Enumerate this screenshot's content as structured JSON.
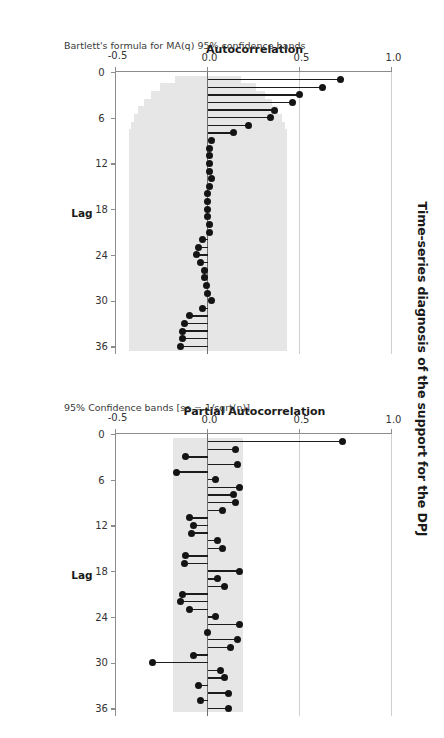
{
  "title": "Time-series diagnosis of the support for the DPJ",
  "orientation_deg": 90,
  "panels": [
    {
      "id": "acf",
      "ylabel": "Autocorrelation",
      "xlabel": "Lag",
      "note": "Bartlett's formula for MA(q) 95% confidence bands"
    },
    {
      "id": "pacf",
      "ylabel": "Partial Autocorrelation",
      "xlabel": "Lag",
      "note": "95% Confidence bands [se = 1/sqrt(n)]"
    }
  ],
  "axis": {
    "y_ticks": [
      "1.0",
      "0.5",
      "0.0",
      "-0.5"
    ],
    "y_tick_values": [
      1.0,
      0.5,
      0.0,
      -0.5
    ],
    "y_min": -0.5,
    "y_max": 1.0,
    "x_ticks": [
      "0",
      "6",
      "12",
      "18",
      "24",
      "30",
      "36"
    ],
    "x_tick_values": [
      0,
      6,
      12,
      18,
      24,
      30,
      36
    ],
    "x_min": 0,
    "x_max": 37
  },
  "colors": {
    "band": "#e6e6e6",
    "marker": "#141414",
    "stem": "#1c1c1c",
    "grid": "#cfcfcf",
    "axis": "#8c8c8c",
    "text": "#1a1a1a",
    "background": "#ffffff"
  },
  "chart_data": [
    {
      "type": "bar",
      "id": "acf",
      "title": "Time-series diagnosis of the support for the DPJ",
      "subtitle": "Bartlett's formula for MA(q) 95% confidence bands",
      "xlabel": "Lag",
      "ylabel": "Autocorrelation",
      "xlim": [
        0,
        37
      ],
      "ylim": [
        -0.5,
        1.0
      ],
      "grid": true,
      "legend": null,
      "marker": "stem-and-dot",
      "categories": [
        1,
        2,
        3,
        4,
        5,
        6,
        7,
        8,
        9,
        10,
        11,
        12,
        13,
        14,
        15,
        16,
        17,
        18,
        19,
        20,
        21,
        22,
        23,
        24,
        25,
        26,
        27,
        28,
        29,
        30,
        31,
        32,
        33,
        34,
        35,
        36
      ],
      "values": [
        0.72,
        0.62,
        0.5,
        0.46,
        0.36,
        0.34,
        0.22,
        0.14,
        0.02,
        0.01,
        0.01,
        0.01,
        0.01,
        0.02,
        0.01,
        0.0,
        0.0,
        0.0,
        0.0,
        0.01,
        0.01,
        -0.03,
        -0.05,
        -0.06,
        -0.04,
        -0.02,
        -0.02,
        -0.01,
        0.0,
        0.02,
        -0.03,
        -0.1,
        -0.13,
        -0.14,
        -0.14,
        -0.15
      ],
      "confidence_band": {
        "label": "Bartlett's formula for MA(q) 95% confidence bands",
        "shape": "widening",
        "upper": [
          0.18,
          0.26,
          0.31,
          0.35,
          0.38,
          0.4,
          0.42,
          0.43,
          0.43,
          0.43,
          0.43,
          0.43,
          0.43,
          0.43,
          0.43,
          0.43,
          0.43,
          0.43,
          0.43,
          0.43,
          0.43,
          0.43,
          0.43,
          0.43,
          0.43,
          0.43,
          0.43,
          0.43,
          0.43,
          0.43,
          0.43,
          0.43,
          0.43,
          0.43,
          0.43,
          0.43
        ],
        "lower": [
          -0.18,
          -0.26,
          -0.31,
          -0.35,
          -0.38,
          -0.4,
          -0.42,
          -0.43,
          -0.43,
          -0.43,
          -0.43,
          -0.43,
          -0.43,
          -0.43,
          -0.43,
          -0.43,
          -0.43,
          -0.43,
          -0.43,
          -0.43,
          -0.43,
          -0.43,
          -0.43,
          -0.43,
          -0.43,
          -0.43,
          -0.43,
          -0.43,
          -0.43,
          -0.43,
          -0.43,
          -0.43,
          -0.43,
          -0.43,
          -0.43,
          -0.43
        ]
      }
    },
    {
      "type": "bar",
      "id": "pacf",
      "title": "Time-series diagnosis of the support for the DPJ",
      "subtitle": "95% Confidence bands [se = 1/sqrt(n)]",
      "xlabel": "Lag",
      "ylabel": "Partial Autocorrelation",
      "xlim": [
        0,
        37
      ],
      "ylim": [
        -0.5,
        1.0
      ],
      "grid": true,
      "legend": null,
      "marker": "stem-and-dot",
      "categories": [
        1,
        2,
        3,
        4,
        5,
        6,
        7,
        8,
        9,
        10,
        11,
        12,
        13,
        14,
        15,
        16,
        17,
        18,
        19,
        20,
        21,
        22,
        23,
        24,
        25,
        26,
        27,
        28,
        29,
        30,
        31,
        32,
        33,
        34,
        35,
        36
      ],
      "values": [
        0.73,
        0.15,
        -0.12,
        0.16,
        -0.17,
        0.04,
        0.17,
        0.14,
        0.15,
        0.08,
        -0.1,
        -0.08,
        -0.09,
        0.05,
        0.08,
        -0.12,
        -0.13,
        0.17,
        0.05,
        0.09,
        -0.14,
        -0.15,
        -0.1,
        0.04,
        0.17,
        0.0,
        0.16,
        0.12,
        -0.08,
        -0.3,
        0.07,
        0.09,
        -0.05,
        0.11,
        -0.04,
        0.11
      ],
      "confidence_band": {
        "label": "95% Confidence bands [se = 1/sqrt(n)]",
        "shape": "constant",
        "upper": 0.19,
        "lower": -0.19
      }
    }
  ]
}
